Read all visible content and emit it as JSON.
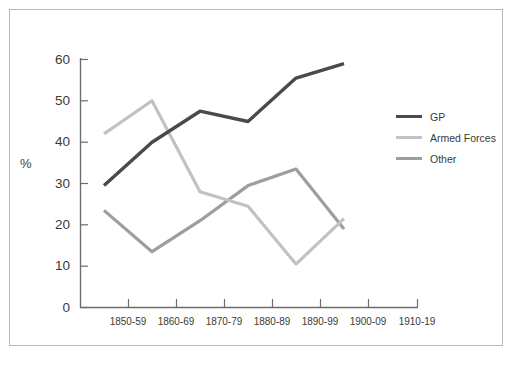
{
  "figure": {
    "border_color": "#b9b9b9",
    "background": "#ffffff"
  },
  "chart_data": {
    "type": "line",
    "title": "",
    "subtitle": "",
    "xlabel": "",
    "ylabel": "%",
    "categories": [
      "1850-59",
      "1860-69",
      "1870-79",
      "1880-89",
      "1890-99",
      "1900-09",
      "1910-19"
    ],
    "ylim": [
      0,
      60
    ],
    "yticks": [
      0,
      10,
      20,
      30,
      40,
      50,
      60
    ],
    "grid": false,
    "legend_position": "right",
    "series": [
      {
        "name": "GP",
        "color": "#4a4a4a",
        "values": [
          29.5,
          40.0,
          47.5,
          45.0,
          55.5,
          59.0,
          null
        ]
      },
      {
        "name": "Armed Forces",
        "color": "#c2c2c2",
        "values": [
          42.0,
          50.0,
          28.0,
          24.5,
          10.5,
          21.5,
          null
        ]
      },
      {
        "name": "Other",
        "color": "#9e9e9e",
        "values": [
          23.5,
          13.5,
          21.0,
          29.5,
          33.5,
          19.0,
          null
        ]
      }
    ]
  },
  "axis": {
    "y_label_text": "%",
    "y_tick_labels": [
      "60",
      "50",
      "40",
      "30",
      "20",
      "10",
      "0"
    ],
    "x_tick_labels": [
      "1850-59",
      "1860-69",
      "1870-79",
      "1880-89",
      "1890-99",
      "1900-09",
      "1910-19"
    ]
  },
  "legend": {
    "items": [
      {
        "label": "GP",
        "color": "#4a4a4a"
      },
      {
        "label": "Armed Forces",
        "color": "#c2c2c2"
      },
      {
        "label": "Other",
        "color": "#9e9e9e"
      }
    ]
  },
  "caption": {
    "text": ""
  }
}
